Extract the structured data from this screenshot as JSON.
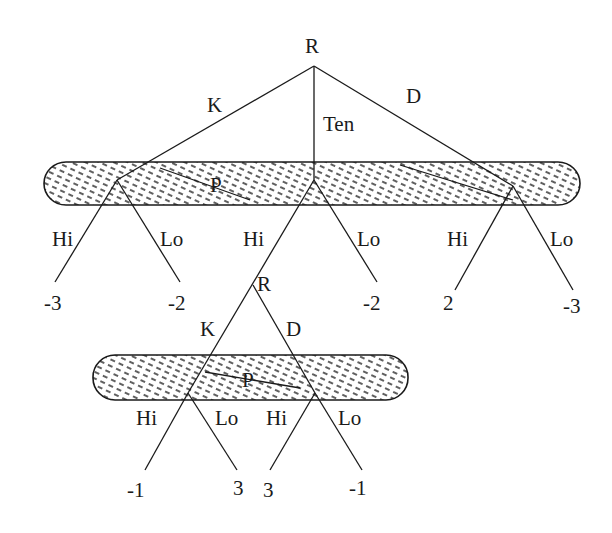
{
  "diagram": {
    "type": "game-tree",
    "colors": {
      "ink": "#1a1a1a",
      "hatch": "#2a2a2a",
      "background": "#ffffff"
    },
    "root": {
      "label": "R"
    },
    "first_moves": [
      {
        "label": "K"
      },
      {
        "label": "Ten"
      },
      {
        "label": "D"
      }
    ],
    "upper_info_set": {
      "label": "P"
    },
    "upper_branches": [
      {
        "hi": "Hi",
        "lo": "Lo",
        "hi_payoff": "-3",
        "lo_payoff": "-2"
      },
      {
        "hi": "Hi",
        "lo": "Lo",
        "lo_payoff": "-2"
      },
      {
        "hi": "Hi",
        "lo": "Lo",
        "hi_payoff": "2",
        "lo_payoff": "-3"
      }
    ],
    "sub_root": {
      "label": "R"
    },
    "sub_moves": [
      {
        "label": "K"
      },
      {
        "label": "D"
      }
    ],
    "lower_info_set": {
      "label": "P"
    },
    "lower_branches": [
      {
        "hi": "Hi",
        "lo": "Lo",
        "hi_payoff": "-1",
        "lo_payoff": "3"
      },
      {
        "hi": "Hi",
        "lo": "Lo",
        "hi_payoff": "3",
        "lo_payoff": "-1"
      }
    ]
  }
}
